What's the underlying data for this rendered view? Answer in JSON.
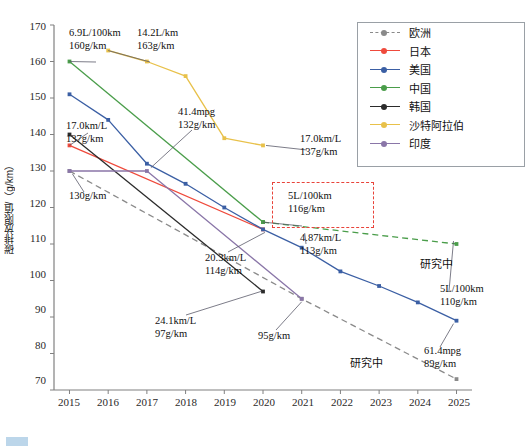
{
  "chart_data": {
    "type": "line",
    "title": "",
    "xlabel": "",
    "ylabel": "碳排放限值/（g/km）",
    "x": [
      2015,
      2016,
      2017,
      2018,
      2019,
      2020,
      2021,
      2022,
      2023,
      2024,
      2025
    ],
    "xlim": [
      2014.6,
      2025.4
    ],
    "ylim": [
      70,
      170
    ],
    "yticks": [
      70,
      80,
      90,
      100,
      110,
      120,
      130,
      140,
      150,
      160,
      170
    ],
    "xticks": [
      "2015",
      "2016",
      "2017",
      "2018",
      "2019",
      "2020",
      "2021",
      "2022",
      "2023",
      "2024",
      "2025"
    ],
    "grid": false,
    "legend_position": "top-right",
    "series": [
      {
        "name": "欧洲",
        "color": "#8a8a8a",
        "style": "dashed",
        "x": [
          2015,
          2021,
          2025
        ],
        "values": [
          130,
          95,
          73
        ]
      },
      {
        "name": "日本",
        "color": "#ef4a3c",
        "style": "solid",
        "x": [
          2015,
          2020
        ],
        "values": [
          137,
          114
        ]
      },
      {
        "name": "美国",
        "color": "#3b5fa4",
        "style": "solid",
        "x": [
          2015,
          2016,
          2017,
          2018,
          2019,
          2020,
          2021,
          2022,
          2023,
          2024,
          2025
        ],
        "values": [
          151,
          144,
          132,
          126.5,
          120,
          114,
          109,
          102.5,
          98.5,
          94,
          89
        ]
      },
      {
        "name": "中国",
        "color": "#4a9d4a",
        "style": "solid",
        "x": [
          2015,
          2020
        ],
        "values": [
          160,
          116
        ]
      },
      {
        "name": "中国研究中",
        "color": "#4a9d4a",
        "style": "dashed",
        "x": [
          2020,
          2025
        ],
        "values": [
          116,
          110
        ]
      },
      {
        "name": "韩国",
        "color": "#2b2b2b",
        "style": "solid",
        "x": [
          2015,
          2020
        ],
        "values": [
          140,
          97
        ]
      },
      {
        "name": "沙特阿拉伯",
        "color": "#e8c14a",
        "style": "solid",
        "x": [
          2016,
          2017,
          2018,
          2019,
          2020
        ],
        "values": [
          163,
          160,
          156,
          139,
          137
        ]
      },
      {
        "name": "印度",
        "color": "#8a76a8",
        "style": "solid",
        "x": [
          2015,
          2017,
          2021
        ],
        "values": [
          130,
          130,
          95
        ]
      }
    ],
    "annotations": [
      {
        "id": "china-2015",
        "lines": [
          "6.9L/100km",
          "160g/km"
        ]
      },
      {
        "id": "saudi-2016",
        "lines": [
          "14.2L/km",
          "163g/km"
        ]
      },
      {
        "id": "japan-2015",
        "lines": [
          "17.0km/L",
          "137g/km"
        ]
      },
      {
        "id": "usa-2017",
        "lines": [
          "41.4mpg",
          "132g/km"
        ]
      },
      {
        "id": "europe-2015",
        "lines": [
          "130g/km"
        ]
      },
      {
        "id": "saudi-2020",
        "lines": [
          "17.0km/L",
          "137g/km"
        ]
      },
      {
        "id": "china-2020-box",
        "lines": [
          "5L/100km",
          "116g/km"
        ]
      },
      {
        "id": "india-2021",
        "lines": [
          "4.87km/L",
          "113g/km"
        ]
      },
      {
        "id": "japan-2020",
        "lines": [
          "20.3km/L",
          "114g/km"
        ]
      },
      {
        "id": "korea-2020",
        "lines": [
          "24.1km/L",
          "97g/km"
        ]
      },
      {
        "id": "europe-2021",
        "lines": [
          "95g/km"
        ]
      },
      {
        "id": "china-2025",
        "lines": [
          "5L/100km",
          "110g/km"
        ]
      },
      {
        "id": "usa-2025",
        "lines": [
          "61.4mpg",
          "89g/km"
        ]
      },
      {
        "id": "china-research",
        "lines": [
          "研究中"
        ]
      },
      {
        "id": "europe-research",
        "lines": [
          "研究中"
        ]
      }
    ]
  },
  "legend": {
    "items": [
      {
        "label": "欧洲",
        "color": "#8a8a8a",
        "style": "dashed"
      },
      {
        "label": "日本",
        "color": "#ef4a3c",
        "style": "solid"
      },
      {
        "label": "美国",
        "color": "#3b5fa4",
        "style": "solid"
      },
      {
        "label": "中国",
        "color": "#4a9d4a",
        "style": "solid"
      },
      {
        "label": "韩国",
        "color": "#2b2b2b",
        "style": "solid"
      },
      {
        "label": "沙特阿拉伯",
        "color": "#e8c14a",
        "style": "solid"
      },
      {
        "label": "印度",
        "color": "#8a76a8",
        "style": "solid"
      }
    ]
  },
  "axes": {
    "y_title": "碳排放限值/（g/km）",
    "y_ticks": [
      "170",
      "160",
      "150",
      "140",
      "130",
      "120",
      "110",
      "100",
      "90",
      "80",
      "70"
    ],
    "x_ticks": [
      "2015",
      "2016",
      "2017",
      "2018",
      "2019",
      "2020",
      "2021",
      "2022",
      "2023",
      "2024",
      "2025"
    ]
  },
  "annotation_text": {
    "china_2015_a": "6.9L/100km",
    "china_2015_b": "160g/km",
    "saudi_2016_a": "14.2L/km",
    "saudi_2016_b": "163g/km",
    "japan_2015_a": "17.0km/L",
    "japan_2015_b": "137g/km",
    "usa_2017_a": "41.4mpg",
    "usa_2017_b": "132g/km",
    "europe_2015_a": "130g/km",
    "saudi_2020_a": "17.0km/L",
    "saudi_2020_b": "137g/km",
    "box_a": "5L/100km",
    "box_b": "116g/km",
    "india_2021_a": "4.87km/L",
    "india_2021_b": "113g/km",
    "japan_2020_a": "20.3km/L",
    "japan_2020_b": "114g/km",
    "korea_2020_a": "24.1km/L",
    "korea_2020_b": "97g/km",
    "europe_2021_a": "95g/km",
    "china_2025_a": "5L/100km",
    "china_2025_b": "110g/km",
    "usa_2025_a": "61.4mpg",
    "usa_2025_b": "89g/km",
    "research_1": "研究中",
    "research_2": "研究中"
  }
}
